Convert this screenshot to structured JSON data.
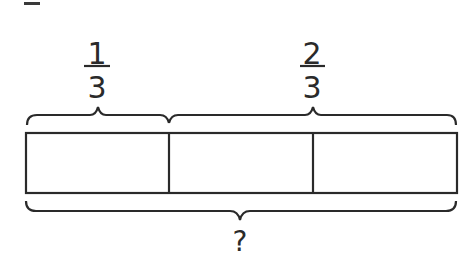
{
  "diagram": {
    "type": "tape-diagram",
    "top_labels": [
      {
        "numerator": "1",
        "denominator": "3",
        "spans_parts": 1
      },
      {
        "numerator": "2",
        "denominator": "3",
        "spans_parts": 2
      }
    ],
    "bar": {
      "parts": 3,
      "equal_parts": true
    },
    "bottom_label": "?",
    "colors": {
      "stroke": "#2a2a2a",
      "background": "#ffffff"
    }
  }
}
